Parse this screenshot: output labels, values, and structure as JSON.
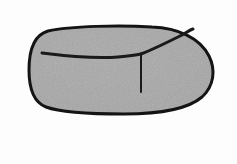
{
  "figure": {
    "title": "Shaded rounded blob with interior crease lines",
    "background_color": "#fdfdfd",
    "fill_color": "#a8a8a8",
    "fill_color_light": "#b4b4b4",
    "fill_color_dark": "#9a9a9a",
    "outline_color": "#141414",
    "line_color": "#1a1a1a",
    "outline_width": 3,
    "interior_line_width": 3,
    "vertical_line_width": 2,
    "canvas": {
      "width": 237,
      "height": 164
    },
    "shapes": {
      "body_outline": {
        "name": "rounded-blob-outline",
        "path": "M 48 31 C 70 26 120 25 152 27 C 178 28 200 38 209 56 C 216 70 214 86 202 97 C 188 109 160 114 124 114 C 92 114 62 113 46 107 C 33 102 29 88 29 70 C 29 50 34 35 48 31 Z"
      },
      "upper_crease_line": {
        "name": "upper-crease-line",
        "path": "M 42 53 C 66 56 96 59 118 57 C 128 56 136 55 141 54"
      },
      "diagonal_crease_line": {
        "name": "diagonal-crease-line",
        "path": "M 141 54 C 154 49 170 41 182 35 C 187 32 190 30 193 29"
      },
      "vertical_crease_line": {
        "name": "vertical-crease-line",
        "path": "M 141 55 C 141 66 141 80 141 92"
      }
    },
    "annotations": {
      "region_left": "left lobe",
      "region_upper_right": "upper-right facet",
      "region_lower": "lower body"
    }
  }
}
